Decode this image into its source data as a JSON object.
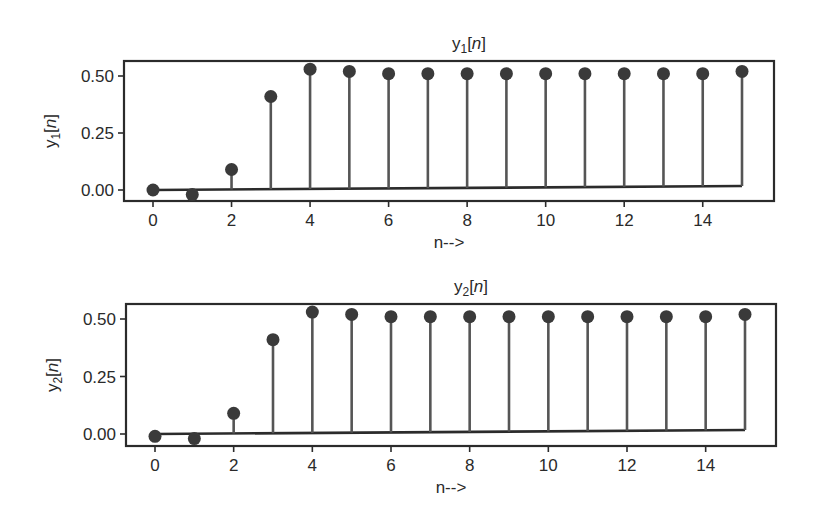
{
  "chart_data": [
    {
      "type": "stem",
      "title": "y1[n]",
      "title_main": "y",
      "title_sub": "1",
      "title_rest": "[n]",
      "xlabel": "n-->",
      "ylabel": "y1[n]",
      "ylabel_main": "y",
      "ylabel_sub": "1",
      "ylabel_rest": "[n]",
      "x": [
        0,
        1,
        2,
        3,
        4,
        5,
        6,
        7,
        8,
        9,
        10,
        11,
        12,
        13,
        14,
        15
      ],
      "values": [
        0.0,
        -0.02,
        0.09,
        0.41,
        0.53,
        0.52,
        0.51,
        0.51,
        0.51,
        0.51,
        0.51,
        0.51,
        0.51,
        0.51,
        0.51,
        0.52
      ],
      "xticks": [
        "0",
        "2",
        "4",
        "6",
        "8",
        "10",
        "12",
        "14"
      ],
      "yticks": [
        "0.00",
        "0.25",
        "0.50"
      ],
      "xlim": [
        -0.5,
        16.5
      ],
      "ylim": [
        -0.05,
        0.56
      ],
      "grid": false,
      "legend": null,
      "layout": {
        "left": 124,
        "top": 61,
        "right": 774,
        "bottom": 201,
        "y0px": 190,
        "y050px": 76,
        "x0px": 153,
        "x15px": 742
      }
    },
    {
      "type": "stem",
      "title": "y2[n]",
      "title_main": "y",
      "title_sub": "2",
      "title_rest": "[n]",
      "xlabel": "n-->",
      "ylabel": "y2[n]",
      "ylabel_main": "y",
      "ylabel_sub": "2",
      "ylabel_rest": "[n]",
      "x": [
        0,
        1,
        2,
        3,
        4,
        5,
        6,
        7,
        8,
        9,
        10,
        11,
        12,
        13,
        14,
        15
      ],
      "values": [
        -0.01,
        -0.02,
        0.09,
        0.41,
        0.53,
        0.52,
        0.51,
        0.51,
        0.51,
        0.51,
        0.51,
        0.51,
        0.51,
        0.51,
        0.51,
        0.52
      ],
      "xticks": [
        "0",
        "2",
        "4",
        "6",
        "8",
        "10",
        "12",
        "14"
      ],
      "yticks": [
        "0.00",
        "0.25",
        "0.50"
      ],
      "xlim": [
        -0.5,
        16.5
      ],
      "ylim": [
        -0.05,
        0.56
      ],
      "grid": false,
      "legend": null,
      "layout": {
        "left": 126,
        "top": 304,
        "right": 776,
        "bottom": 446,
        "y0px": 434,
        "y050px": 319,
        "x0px": 155,
        "x15px": 745
      }
    }
  ]
}
